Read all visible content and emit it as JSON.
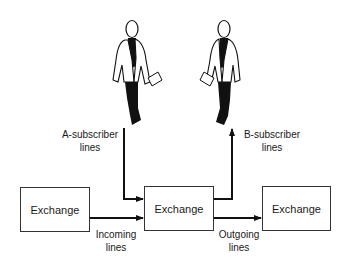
{
  "diagram": {
    "exchanges": [
      {
        "id": "left",
        "label": "Exchange"
      },
      {
        "id": "middle",
        "label": "Exchange"
      },
      {
        "id": "right",
        "label": "Exchange"
      }
    ],
    "labels": {
      "a_subscriber": "A-subscriber lines",
      "a_subscriber_line1": "A-subscriber",
      "a_subscriber_line2": "lines",
      "b_subscriber_line1": "B-subscriber",
      "b_subscriber_line2": "lines",
      "incoming_line1": "Incoming",
      "incoming_line2": "lines",
      "outgoing_line1": "Outgoing",
      "outgoing_line2": "lines"
    },
    "figures": [
      {
        "id": "a-subscriber",
        "icon": "person-walking-icon"
      },
      {
        "id": "b-subscriber",
        "icon": "person-walking-icon"
      }
    ],
    "colors": {
      "line": "#111111",
      "box_border": "#333333"
    }
  }
}
